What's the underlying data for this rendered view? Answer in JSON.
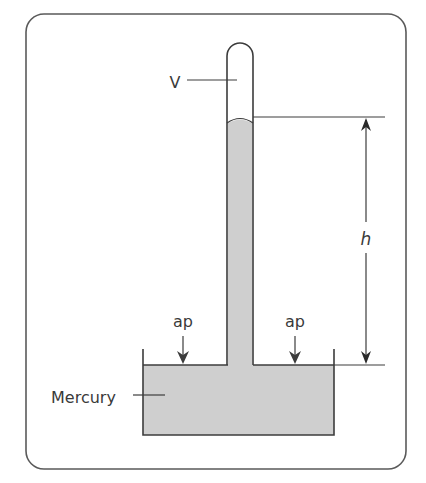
{
  "diagram": {
    "type": "mercury-barometer",
    "labels": {
      "vacuum": "V",
      "height": "h",
      "atmospheric_pressure_left": "ap",
      "atmospheric_pressure_right": "ap",
      "fluid": "Mercury"
    },
    "colors": {
      "frame": "#5a5a5a",
      "line": "#3c3c3c",
      "mercury_fill": "#cfcfcf",
      "background": "#ffffff",
      "text": "#3a3a3a"
    }
  }
}
